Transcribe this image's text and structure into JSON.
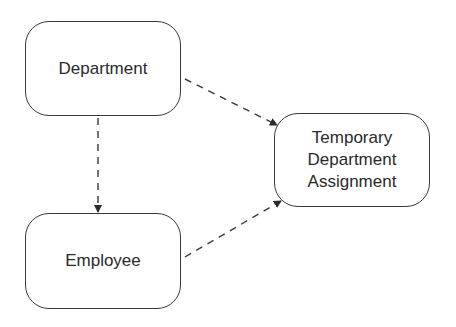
{
  "diagram": {
    "nodes": [
      {
        "id": "department",
        "label": "Department"
      },
      {
        "id": "employee",
        "label": "Employee"
      },
      {
        "id": "temporary",
        "lines": [
          "Temporary",
          "Department",
          "Assignment"
        ]
      }
    ],
    "edges": [
      {
        "from": "department",
        "to": "employee",
        "style": "dashed",
        "arrow": "end"
      },
      {
        "from": "department",
        "to": "temporary",
        "style": "dashed",
        "arrow": "end"
      },
      {
        "from": "employee",
        "to": "temporary",
        "style": "dashed",
        "arrow": "end"
      }
    ],
    "colors": {
      "stroke": "#3a3a3a",
      "text": "#2a2a2a",
      "background": "#ffffff"
    }
  }
}
